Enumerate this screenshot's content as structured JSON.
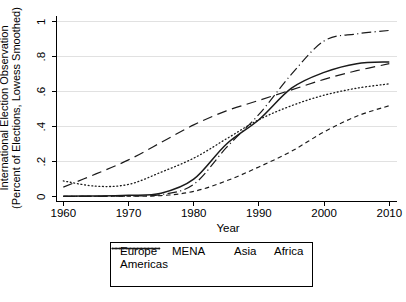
{
  "chart_data": {
    "type": "line",
    "title": "",
    "xlabel": "Year",
    "ylabel": "International Election Observation (Percent of Elections, Lowess Smoothed)",
    "ylabel_lines": [
      "International Election Observation",
      "(Percent of Elections, Lowess Smoothed)"
    ],
    "x": [
      1960,
      1965,
      1970,
      1975,
      1980,
      1985,
      1990,
      1995,
      2000,
      2005,
      2010
    ],
    "x_ticks": [
      "1960",
      "1970",
      "1980",
      "1990",
      "2000",
      "2010"
    ],
    "y_ticks": [
      {
        "label": "0",
        "value": 0
      },
      {
        "label": ".2",
        "value": 0.2
      },
      {
        "label": ".4",
        "value": 0.4
      },
      {
        "label": ".6",
        "value": 0.6
      },
      {
        "label": ".8",
        "value": 0.8
      },
      {
        "label": "1",
        "value": 1
      }
    ],
    "xlim": [
      1960,
      2010
    ],
    "ylim": [
      0,
      1
    ],
    "grid": true,
    "line_color": "#1a1a1a",
    "grid_color": "#dedede",
    "legend_position": "below",
    "series": [
      {
        "name": "Europe",
        "line_style": "solid",
        "values": [
          0.003,
          0.004,
          0.008,
          0.02,
          0.1,
          0.3,
          0.44,
          0.62,
          0.71,
          0.76,
          0.77
        ]
      },
      {
        "name": "Asia",
        "line_style": "dotted",
        "values": [
          0.09,
          0.06,
          0.07,
          0.14,
          0.22,
          0.33,
          0.44,
          0.52,
          0.58,
          0.62,
          0.645
        ]
      },
      {
        "name": "Americas",
        "line_style": "longdash",
        "values": [
          0.055,
          0.13,
          0.21,
          0.31,
          0.41,
          0.49,
          0.55,
          0.61,
          0.67,
          0.72,
          0.76
        ]
      },
      {
        "name": "MENA",
        "line_style": "shortdash",
        "values": [
          0.002,
          0.002,
          0.003,
          0.006,
          0.03,
          0.09,
          0.17,
          0.26,
          0.37,
          0.46,
          0.52
        ]
      },
      {
        "name": "Africa",
        "line_style": "dashdot",
        "values": [
          0.002,
          0.002,
          0.004,
          0.012,
          0.07,
          0.28,
          0.47,
          0.7,
          0.89,
          0.93,
          0.95
        ]
      }
    ],
    "legend_rows": [
      [
        "Europe",
        "MENA"
      ],
      [
        "Asia",
        "Africa"
      ],
      [
        "Americas",
        null
      ]
    ]
  }
}
